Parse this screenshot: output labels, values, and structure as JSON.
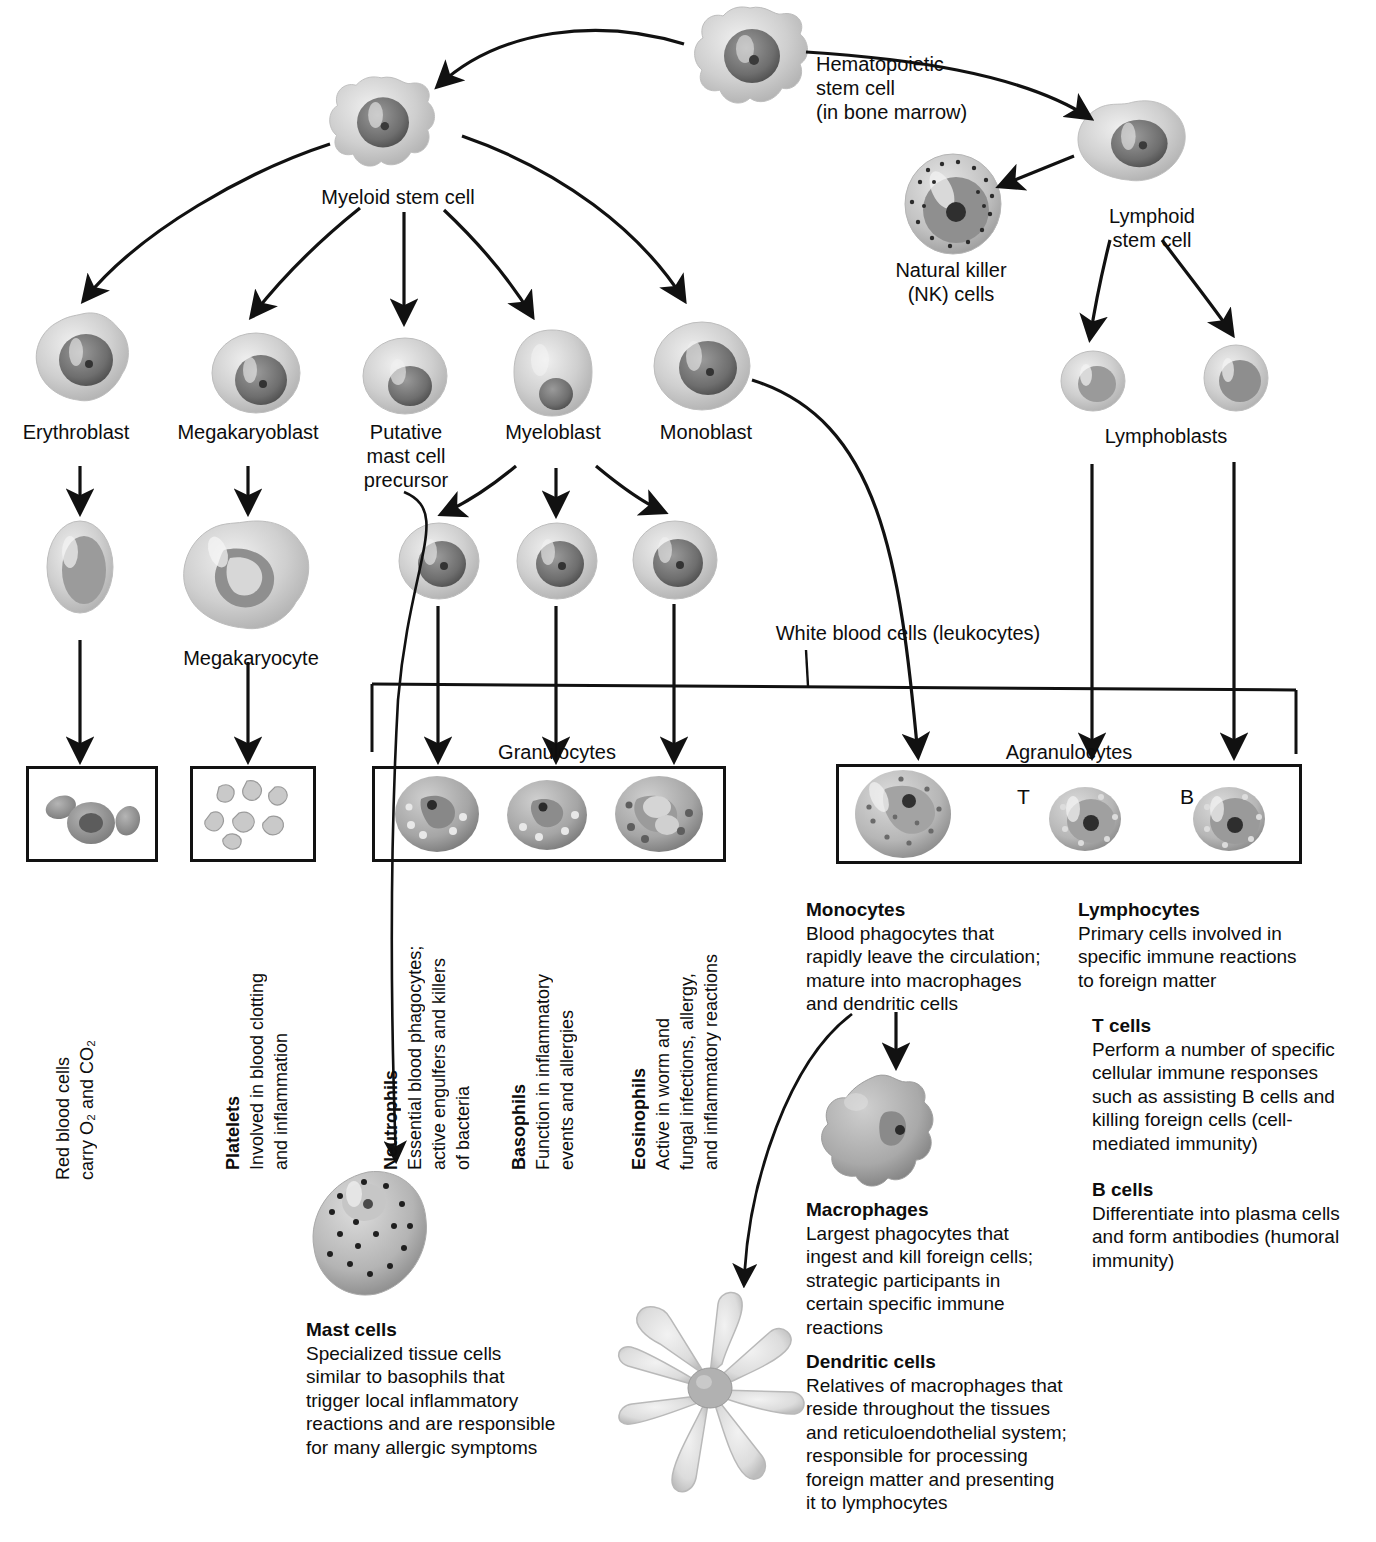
{
  "diagram": {
    "nodes": {
      "hematopoietic_stem_cell": "Hematopoietic\nstem cell\n(in bone marrow)",
      "myeloid_stem_cell": "Myeloid stem cell",
      "lymphoid_stem_cell": "Lymphoid\nstem cell",
      "natural_killer": "Natural killer\n(NK) cells",
      "erythroblast": "Erythroblast",
      "megakaryoblast": "Megakaryoblast",
      "putative_mast_cell_precursor": "Putative\nmast cell\nprecursor",
      "myeloblast": "Myeloblast",
      "monoblast": "Monoblast",
      "lymphoblasts": "Lymphoblasts",
      "megakaryocyte": "Megakaryocyte",
      "white_blood_cells": "White blood cells (leukocytes)",
      "granulocytes": "Granulocytes",
      "agranulocytes": "Agranulocytes",
      "t_marker": "T",
      "b_marker": "B"
    },
    "vertical_captions": {
      "red_blood_cells": {
        "line1": "Red blood cells",
        "line2": "carry O₂ and CO₂"
      },
      "platelets": {
        "heading": "Platelets",
        "body_line1": "Involved in blood clotting",
        "body_line2": "and inflammation"
      },
      "neutrophils": {
        "heading": "Neutrophils",
        "body_line1": "Essential blood phagocytes;",
        "body_line2": "active engulfers and killers",
        "body_line3": "of bacteria"
      },
      "basophils": {
        "heading": "Basophils",
        "body_line1": "Function in inflammatory",
        "body_line2": "events and allergies"
      },
      "eosinophils": {
        "heading": "Eosinophils",
        "body_line1": "Active in worm and",
        "body_line2": "fungal infections, allergy,",
        "body_line3": "and inflammatory reactions"
      }
    },
    "captions": {
      "monocytes": {
        "heading": "Monocytes",
        "body": "Blood phagocytes that\nrapidly leave the circulation;\nmature into macrophages\nand dendritic cells"
      },
      "lymphocytes": {
        "heading": "Lymphocytes",
        "body": "Primary cells involved in\nspecific immune reactions\nto foreign matter"
      },
      "t_cells": {
        "heading": "T cells",
        "body": "Perform a number of specific\ncellular immune responses\nsuch as assisting B cells and\nkilling foreign cells (cell-\nmediated immunity)"
      },
      "b_cells": {
        "heading": "B cells",
        "body": "Differentiate into plasma cells\nand form antibodies (humoral\nimmunity)"
      },
      "macrophages": {
        "heading": "Macrophages",
        "body": "Largest phagocytes that\ningest and kill foreign cells;\nstrategic participants in\ncertain specific immune\nreactions"
      },
      "dendritic_cells": {
        "heading": "Dendritic cells",
        "body": "Relatives of macrophages that\nreside throughout the tissues\nand reticuloendothelial system;\nresponsible for processing\nforeign matter and presenting\nit to lymphocytes"
      },
      "mast_cells": {
        "heading": "Mast cells",
        "body": "Specialized tissue cells\nsimilar to basophils that\ntrigger local inflammatory\nreactions and are responsible\nfor many allergic symptoms"
      }
    },
    "colors": {
      "ink": "#111111",
      "cell_light": "#d9d9d9",
      "cell_mid": "#a8a8a8",
      "cell_dark": "#636363",
      "nucleus": "#4a4a4a",
      "background": "#ffffff"
    }
  }
}
